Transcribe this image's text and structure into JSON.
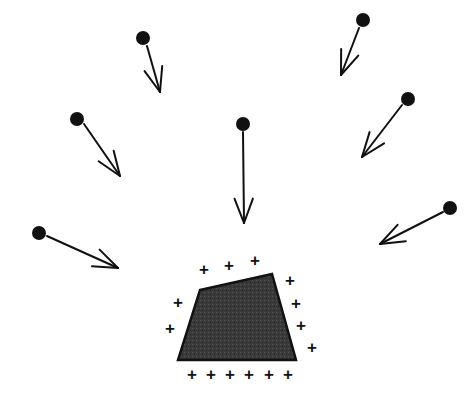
{
  "figure": {
    "title": "",
    "width": 474,
    "height": 401,
    "background_color": "#ffffff"
  },
  "colors": {
    "stroke": "#111111",
    "dot_fill": "#111111",
    "polygon_fill": "#3a3a3a",
    "polygon_stroke": "#111111",
    "plus_color": "#111111",
    "background": "#ffffff"
  },
  "arrows": [
    {
      "name": "arrow-top-left-inner",
      "dot": {
        "cx": 143,
        "cy": 38,
        "r": 7
      },
      "tail": {
        "x": 147,
        "y": 46
      },
      "tip": {
        "x": 160,
        "y": 92
      },
      "direction": "down-right"
    },
    {
      "name": "arrow-left-upper",
      "dot": {
        "cx": 77,
        "cy": 119,
        "r": 7
      },
      "tail": {
        "x": 84,
        "y": 124
      },
      "tip": {
        "x": 120,
        "y": 176
      },
      "direction": "down-right"
    },
    {
      "name": "arrow-left-lower",
      "dot": {
        "cx": 39,
        "cy": 233,
        "r": 7
      },
      "tail": {
        "x": 47,
        "y": 236
      },
      "tip": {
        "x": 118,
        "y": 268
      },
      "direction": "right-down"
    },
    {
      "name": "arrow-center",
      "dot": {
        "cx": 243,
        "cy": 124,
        "r": 7
      },
      "tail": {
        "x": 243,
        "y": 132
      },
      "tip": {
        "x": 244,
        "y": 223
      },
      "direction": "down"
    },
    {
      "name": "arrow-top-right-inner",
      "dot": {
        "cx": 363,
        "cy": 20,
        "r": 7
      },
      "tail": {
        "x": 359,
        "y": 28
      },
      "tip": {
        "x": 341,
        "y": 75
      },
      "direction": "down-left"
    },
    {
      "name": "arrow-right-upper",
      "dot": {
        "cx": 408,
        "cy": 99,
        "r": 7
      },
      "tail": {
        "x": 402,
        "y": 105
      },
      "tip": {
        "x": 362,
        "y": 157
      },
      "direction": "down-left"
    },
    {
      "name": "arrow-right-lower",
      "dot": {
        "cx": 450,
        "cy": 208,
        "r": 7
      },
      "tail": {
        "x": 443,
        "y": 212
      },
      "tip": {
        "x": 380,
        "y": 244
      },
      "direction": "left-down"
    }
  ],
  "polygon": {
    "name": "shaded-quadrilateral",
    "points": "200,290 272,274 296,360 178,360",
    "fill": "#3a3a3a",
    "stroke": "#111111",
    "stroke_width": 2.5
  },
  "plus_marks": {
    "glyph": "+",
    "font_size": 17,
    "positions": [
      {
        "x": 204,
        "y": 269
      },
      {
        "x": 229,
        "y": 265
      },
      {
        "x": 255,
        "y": 260
      },
      {
        "x": 290,
        "y": 280
      },
      {
        "x": 296,
        "y": 303
      },
      {
        "x": 301,
        "y": 325
      },
      {
        "x": 312,
        "y": 347
      },
      {
        "x": 178,
        "y": 302
      },
      {
        "x": 170,
        "y": 328
      },
      {
        "x": 192,
        "y": 374
      },
      {
        "x": 211,
        "y": 374
      },
      {
        "x": 230,
        "y": 374
      },
      {
        "x": 249,
        "y": 374
      },
      {
        "x": 269,
        "y": 374
      },
      {
        "x": 288,
        "y": 374
      }
    ]
  }
}
